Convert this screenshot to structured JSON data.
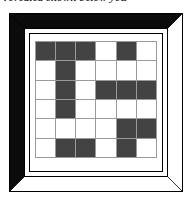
{
  "caption": {
    "text": "revealed shown below you"
  },
  "frame": {
    "name": "beveled-picture-frame",
    "bevel_dark_color": "#0b0b0b",
    "bevel_light_color": "#ffffff",
    "outline_color": "#000000",
    "mat_color": "#ffffff"
  },
  "puzzle": {
    "type": "grid-pattern",
    "rows": 6,
    "columns": 6,
    "dark_color": "#434343",
    "light_color": "#ffffff",
    "gridline_color": "#9a9a9a",
    "legend": {
      "1": "dark",
      "0": "light"
    },
    "cells": [
      [
        1,
        1,
        1,
        0,
        1,
        0
      ],
      [
        0,
        1,
        0,
        0,
        0,
        0
      ],
      [
        0,
        1,
        0,
        1,
        1,
        1
      ],
      [
        0,
        1,
        0,
        0,
        0,
        0
      ],
      [
        0,
        0,
        0,
        0,
        1,
        1
      ],
      [
        0,
        1,
        1,
        0,
        1,
        0
      ]
    ],
    "dark_count": 18,
    "light_count": 18
  }
}
